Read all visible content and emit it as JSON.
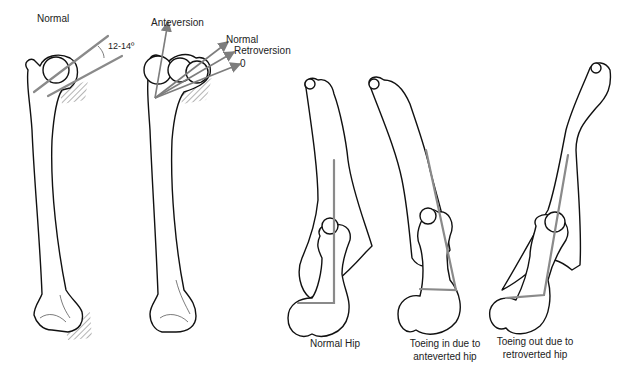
{
  "figure": {
    "left_panel": {
      "normal_femur": {
        "title": "Normal",
        "angle_label": "12-14º"
      },
      "version_femur": {
        "arrow_labels": {
          "anteversion": "Anteversion",
          "normal": "Normal",
          "retroversion": "Retroversion",
          "zero": "0"
        }
      }
    },
    "right_panel": {
      "captions": [
        {
          "id": "normal-hip",
          "lines": [
            "Normal Hip"
          ]
        },
        {
          "id": "toeing-in",
          "lines": [
            "Toeing in due to",
            "anteverted hip"
          ]
        },
        {
          "id": "toeing-out",
          "lines": [
            "Toeing out due to",
            "retroverted hip"
          ]
        }
      ]
    },
    "colors": {
      "line_art": "#111111",
      "axis_lines": "#8a8a8a",
      "background": "#ffffff"
    }
  }
}
